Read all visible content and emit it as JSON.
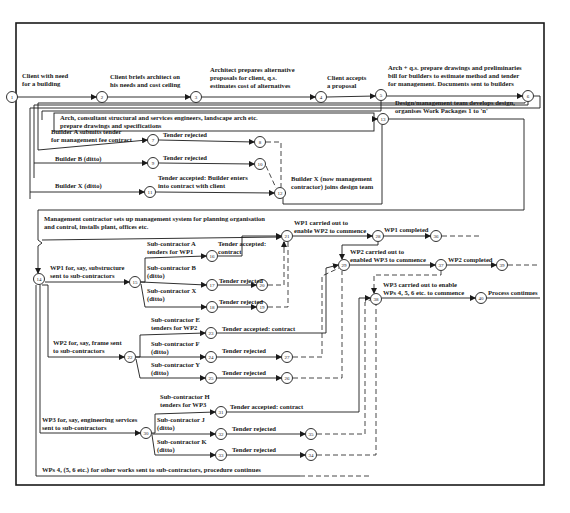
{
  "diagram": {
    "nodes": [
      {
        "id": "1",
        "x": 12,
        "y": 97
      },
      {
        "id": "2",
        "x": 102,
        "y": 97
      },
      {
        "id": "3",
        "x": 196,
        "y": 97
      },
      {
        "id": "4",
        "x": 321,
        "y": 97
      },
      {
        "id": "5",
        "x": 381,
        "y": 95
      },
      {
        "id": "6",
        "x": 528,
        "y": 96
      },
      {
        "id": "7",
        "x": 153,
        "y": 140
      },
      {
        "id": "8",
        "x": 260,
        "y": 142
      },
      {
        "id": "9",
        "x": 153,
        "y": 163
      },
      {
        "id": "10",
        "x": 260,
        "y": 164
      },
      {
        "id": "11",
        "x": 150,
        "y": 192
      },
      {
        "id": "12",
        "x": 280,
        "y": 193
      },
      {
        "id": "13",
        "x": 383,
        "y": 119
      },
      {
        "id": "14",
        "x": 39,
        "y": 279
      },
      {
        "id": "15",
        "x": 135,
        "y": 282
      },
      {
        "id": "16",
        "x": 212,
        "y": 256
      },
      {
        "id": "17",
        "x": 212,
        "y": 285
      },
      {
        "id": "18",
        "x": 212,
        "y": 307
      },
      {
        "id": "19",
        "x": 262,
        "y": 307
      },
      {
        "id": "20",
        "x": 262,
        "y": 285
      },
      {
        "id": "21",
        "x": 287,
        "y": 236
      },
      {
        "id": "22",
        "x": 130,
        "y": 357
      },
      {
        "id": "23",
        "x": 211,
        "y": 333
      },
      {
        "id": "24",
        "x": 211,
        "y": 357
      },
      {
        "id": "25",
        "x": 211,
        "y": 378
      },
      {
        "id": "26",
        "x": 287,
        "y": 378
      },
      {
        "id": "27",
        "x": 287,
        "y": 357
      },
      {
        "id": "28",
        "x": 378,
        "y": 236
      },
      {
        "id": "29",
        "x": 344,
        "y": 265
      },
      {
        "id": "30",
        "x": 146,
        "y": 433
      },
      {
        "id": "31",
        "x": 221,
        "y": 412
      },
      {
        "id": "32",
        "x": 221,
        "y": 434
      },
      {
        "id": "33",
        "x": 221,
        "y": 455
      },
      {
        "id": "34",
        "x": 311,
        "y": 455
      },
      {
        "id": "35",
        "x": 311,
        "y": 434
      },
      {
        "id": "36",
        "x": 436,
        "y": 236
      },
      {
        "id": "37",
        "x": 441,
        "y": 265
      },
      {
        "id": "38",
        "x": 376,
        "y": 299
      },
      {
        "id": "39",
        "x": 502,
        "y": 265
      },
      {
        "id": "40",
        "x": 481,
        "y": 298
      }
    ],
    "labels": {
      "l1": [
        "Client with need",
        "for a building"
      ],
      "l2": [
        "Client briefs architect on",
        "his needs and cost ceiling"
      ],
      "l3": [
        "Architect prepares alternative",
        "proposals for client, q.s.",
        "estimates cost of alternatives"
      ],
      "l4": [
        "Client accepts",
        "a proposal"
      ],
      "l5": [
        "Arch + q.s. prepare drawings and preliminaries",
        "bill for builders to estimate method and tender",
        "for management. Documents sent to builders"
      ],
      "l6": [
        "Arch, consultant structural and services engineers, landscape arch etc.",
        "prepare drawings and specifications"
      ],
      "l7": [
        "Builder A submits tender",
        "for management fee contract"
      ],
      "l7r": "Tender rejected",
      "l9": "Builder B (ditto)",
      "l9r": "Tender rejected",
      "l11": "Builder X (ditto)",
      "l11a": [
        "Tender accepted: Builder enters",
        "into contract with client"
      ],
      "l12": [
        "Builder X (now management",
        "contractor) joins design team"
      ],
      "l13": [
        "Design/management team develops design,",
        "organises Work Packages 1 to 'n'"
      ],
      "l14": [
        "Management contractor sets up management system for planning organisation",
        "and control, installs plant, offices etc."
      ],
      "lwp1": [
        "WP1 for, say, substructure",
        "sent to sub-contractors"
      ],
      "lsa": [
        "Sub-contractor A",
        "tenders for WP1"
      ],
      "lsaa": [
        "Tender accepted:",
        "contract"
      ],
      "lsb": [
        "Sub-contractor B",
        "(ditto)"
      ],
      "lsbr": "Tender rejected",
      "lsx": [
        "Sub-contractor X",
        "(ditto)"
      ],
      "lsxr": "Tender rejected",
      "lwp1c": [
        "WP1 carried out to",
        "enable WP2 to commence"
      ],
      "lwp1d": "WP1 completed",
      "lwp2c": [
        "WP2 carried out to",
        "enabled WP3 to commence"
      ],
      "lwp2d": "WP2 completed",
      "lwp3c": [
        "WP3 carried out to enable",
        "WPs 4, 5, 6 etc. to commence"
      ],
      "lproc": "Process continues",
      "lse": [
        "Sub-contractor E",
        "tenders for WP2"
      ],
      "lsea": "Tender accepted: contract",
      "lwp2": [
        "WP2 for, say, frame sent",
        "to sub-contractors"
      ],
      "lsf": [
        "Sub-contractor F",
        "(ditto)"
      ],
      "lsfr": "Tender rejected",
      "lsy": [
        "Sub-contractor Y",
        "(ditto)"
      ],
      "lsyr": "Tender rejected",
      "lsh": [
        "Sub-contractor H",
        "tenders for WP3"
      ],
      "lsha": "Tender accepted: contract",
      "lwp3": [
        "WP3 for, say, engineering services",
        "sent to sub-contractors"
      ],
      "lsj": [
        "Sub-contractor J",
        "(ditto)"
      ],
      "lsjr": "Tender rejected",
      "lsk": [
        "Sub-contractor K",
        "(ditto)"
      ],
      "lskr": "Tender rejected",
      "lwps": "WPs 4, (5, 6 etc.) for other works sent to sub-contractors, procedure continues"
    }
  }
}
